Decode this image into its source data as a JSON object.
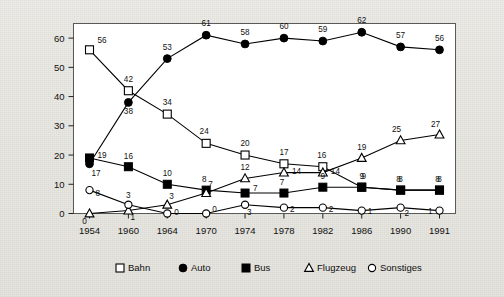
{
  "chart_data": {
    "type": "line",
    "title": "",
    "subtitle": "",
    "xlabel": "",
    "ylabel": "",
    "categories": [
      "1954",
      "1960",
      "1964",
      "1970",
      "1974",
      "1978",
      "1982",
      "1986",
      "1990",
      "1991"
    ],
    "x": [
      1954,
      1960,
      1964,
      1970,
      1974,
      1978,
      1982,
      1986,
      1990,
      1991
    ],
    "ylim": [
      0,
      65
    ],
    "yticks": [
      0,
      10,
      20,
      30,
      40,
      50,
      60
    ],
    "ytick_labels": [
      "0",
      "10",
      "20",
      "30",
      "40",
      "50",
      "60"
    ],
    "grid": false,
    "legend_position": "bottom",
    "data_labels": true,
    "series": [
      {
        "name": "Bahn",
        "marker": "open-square",
        "color": "#000000",
        "values": [
          56,
          42,
          34,
          24,
          20,
          17,
          16,
          9,
          8,
          8
        ]
      },
      {
        "name": "Auto",
        "marker": "filled-circle",
        "color": "#000000",
        "values": [
          17,
          38,
          53,
          61,
          58,
          60,
          59,
          62,
          57,
          56
        ]
      },
      {
        "name": "Bus",
        "marker": "filled-square",
        "color": "#000000",
        "values": [
          19,
          16,
          10,
          8,
          7,
          7,
          9,
          9,
          8,
          8
        ]
      },
      {
        "name": "Flugzeug",
        "marker": "open-triangle",
        "color": "#000000",
        "values": [
          0,
          1,
          3,
          7,
          12,
          14,
          14,
          19,
          25,
          27
        ]
      },
      {
        "name": "Sonstiges",
        "marker": "open-circle",
        "color": "#000000",
        "values": [
          8,
          3,
          0,
          0,
          3,
          2,
          2,
          1,
          2,
          1
        ]
      }
    ]
  },
  "legend": {
    "items": [
      {
        "label": "Bahn",
        "marker": "open-square"
      },
      {
        "label": "Auto",
        "marker": "filled-circle"
      },
      {
        "label": "Bus",
        "marker": "filled-square"
      },
      {
        "label": "Flugzeug",
        "marker": "open-triangle"
      },
      {
        "label": "Sonstiges",
        "marker": "open-circle"
      }
    ]
  },
  "colors": {
    "page_background": "#e8e7e2",
    "plot_background": "#ffffff",
    "ink": "#000000",
    "frame": "#5a5a5a"
  }
}
